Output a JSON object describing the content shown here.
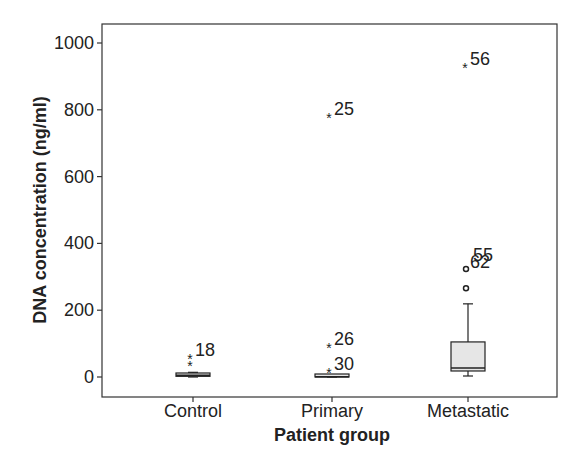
{
  "chart_data": {
    "type": "boxplot",
    "title": "",
    "xlabel": "Patient group",
    "ylabel": "DNA concentration (ng/ml)",
    "ylim": [
      -55,
      1060
    ],
    "yticks": [
      0,
      200,
      400,
      600,
      800,
      1000
    ],
    "grid": false,
    "legend": null,
    "categories": [
      "Control",
      "Primary",
      "Metastatic"
    ],
    "boxes": [
      {
        "category": "Control",
        "whisker_low": 0,
        "q1": 2,
        "median": 5,
        "q3": 12,
        "whisker_high": 14,
        "outliers": [
          {
            "value": 60,
            "marker": "asterisk",
            "label": "18"
          },
          {
            "value": 39,
            "marker": "asterisk",
            "label": ""
          }
        ]
      },
      {
        "category": "Primary",
        "whisker_low": 0,
        "q1": 0,
        "median": 1,
        "q3": 2,
        "whisker_high": 3,
        "outliers": [
          {
            "value": 781,
            "marker": "asterisk",
            "label": "25"
          },
          {
            "value": 93,
            "marker": "asterisk",
            "label": "26"
          },
          {
            "value": 18,
            "marker": "asterisk",
            "label": "30"
          }
        ]
      },
      {
        "category": "Metastatic",
        "whisker_low": 3,
        "q1": 18,
        "median": 27,
        "q3": 105,
        "whisker_high": 219,
        "outliers": [
          {
            "value": 931,
            "marker": "asterisk",
            "label": "56"
          },
          {
            "value": 323,
            "marker": "circle",
            "label": "62"
          },
          {
            "value": 266,
            "marker": "circle",
            "label": ""
          }
        ],
        "extra_labels": [
          {
            "text": "55",
            "value": 360
          }
        ]
      }
    ]
  },
  "axes": {
    "y_tick_labels": [
      "0",
      "200",
      "400",
      "600",
      "800",
      "1000"
    ],
    "x_tick_labels": [
      "Control",
      "Primary",
      "Metastatic"
    ],
    "x_title": "Patient group",
    "y_title": "DNA concentration (ng/ml)"
  },
  "colors": {
    "box_fill": "#e6e6e6",
    "stroke": "#222222"
  }
}
